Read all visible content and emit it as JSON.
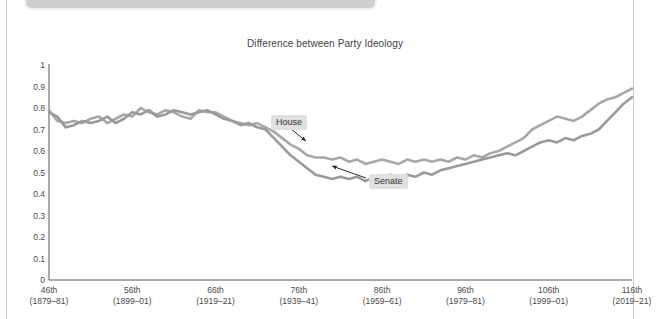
{
  "page": {
    "top_panel": {
      "present": true,
      "dot": "panel-dot"
    }
  },
  "chart": {
    "title": "Difference between Party Ideology"
  },
  "annotations": [
    {
      "label": "House"
    },
    {
      "label": "Senate"
    }
  ],
  "chart_data": {
    "type": "line",
    "title": "Difference between Party Ideology",
    "xlabel": "",
    "ylabel": "",
    "ylim": [
      0,
      1
    ],
    "ytick_labels": [
      "1",
      "0.9",
      "0.8",
      "0.7",
      "0.6",
      "0.5",
      "0.4",
      "0.3",
      "0.2",
      "0.1",
      "0"
    ],
    "ytick_values": [
      1,
      0.9,
      0.8,
      0.7,
      0.6,
      0.5,
      0.4,
      0.3,
      0.2,
      0.1,
      0
    ],
    "grid": false,
    "legend_position": "inline-annotations",
    "xtick_labels": [
      "46th\n(1879–81)",
      "56th\n(1899–01)",
      "66th\n(1919–21)",
      "76th\n(1939–41)",
      "86th\n(1959–61)",
      "96th\n(1979–81)",
      "106th\n(1999–01)",
      "116th\n(2019–21)"
    ],
    "xticks": [
      {
        "congress": "46th",
        "years": "(1879–81)"
      },
      {
        "congress": "56th",
        "years": "(1899–01)"
      },
      {
        "congress": "66th",
        "years": "(1919–21)"
      },
      {
        "congress": "76th",
        "years": "(1939–41)"
      },
      {
        "congress": "86th",
        "years": "(1959–61)"
      },
      {
        "congress": "96th",
        "years": "(1979–81)"
      },
      {
        "congress": "106th",
        "years": "(1999–01)"
      },
      {
        "congress": "116th",
        "years": "(2019–21)"
      }
    ],
    "x": [
      46,
      47,
      48,
      49,
      50,
      51,
      52,
      53,
      54,
      55,
      56,
      57,
      58,
      59,
      60,
      61,
      62,
      63,
      64,
      65,
      66,
      67,
      68,
      69,
      70,
      71,
      72,
      73,
      74,
      75,
      76,
      77,
      78,
      79,
      80,
      81,
      82,
      83,
      84,
      85,
      86,
      87,
      88,
      89,
      90,
      91,
      92,
      93,
      94,
      95,
      96,
      97,
      98,
      99,
      100,
      101,
      102,
      103,
      104,
      105,
      106,
      107,
      108,
      109,
      110,
      111,
      112,
      113,
      114,
      115,
      116
    ],
    "series": [
      {
        "name": "House",
        "color": "#a8a8a8",
        "values": [
          0.79,
          0.74,
          0.73,
          0.74,
          0.73,
          0.75,
          0.76,
          0.73,
          0.75,
          0.77,
          0.76,
          0.8,
          0.78,
          0.77,
          0.79,
          0.78,
          0.76,
          0.75,
          0.79,
          0.78,
          0.78,
          0.76,
          0.74,
          0.73,
          0.72,
          0.73,
          0.71,
          0.69,
          0.66,
          0.63,
          0.61,
          0.58,
          0.57,
          0.57,
          0.56,
          0.57,
          0.55,
          0.56,
          0.54,
          0.55,
          0.56,
          0.55,
          0.54,
          0.56,
          0.55,
          0.56,
          0.55,
          0.56,
          0.55,
          0.57,
          0.56,
          0.58,
          0.57,
          0.59,
          0.6,
          0.62,
          0.64,
          0.66,
          0.7,
          0.72,
          0.74,
          0.76,
          0.75,
          0.74,
          0.76,
          0.79,
          0.82,
          0.84,
          0.85,
          0.87,
          0.89
        ]
      },
      {
        "name": "Senate",
        "color": "#9a9a9a",
        "values": [
          0.78,
          0.76,
          0.71,
          0.72,
          0.74,
          0.73,
          0.74,
          0.76,
          0.73,
          0.75,
          0.78,
          0.77,
          0.79,
          0.76,
          0.77,
          0.79,
          0.78,
          0.77,
          0.78,
          0.79,
          0.77,
          0.75,
          0.74,
          0.72,
          0.73,
          0.71,
          0.7,
          0.66,
          0.62,
          0.58,
          0.55,
          0.52,
          0.49,
          0.48,
          0.47,
          0.48,
          0.47,
          0.48,
          0.46,
          0.48,
          0.47,
          0.49,
          0.48,
          0.49,
          0.48,
          0.5,
          0.49,
          0.51,
          0.52,
          0.53,
          0.54,
          0.55,
          0.56,
          0.57,
          0.58,
          0.59,
          0.58,
          0.6,
          0.62,
          0.64,
          0.65,
          0.64,
          0.66,
          0.65,
          0.67,
          0.68,
          0.7,
          0.74,
          0.78,
          0.82,
          0.85
        ]
      }
    ]
  }
}
